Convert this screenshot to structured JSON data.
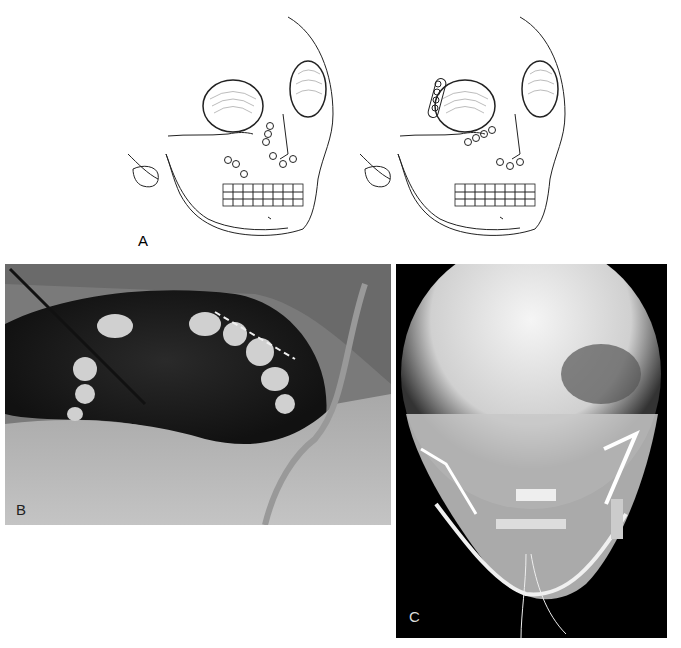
{
  "figure": {
    "panels": [
      {
        "id": "A",
        "label": "A",
        "description": "Line illustrations of skull showing fracture fixation with miniplates and arch bars, two views"
      },
      {
        "id": "B",
        "label": "B",
        "description": "Intraoperative photograph of oral cavity with arch bar on teeth and instrument"
      },
      {
        "id": "C",
        "label": "C",
        "description": "Frontal radiograph of skull showing plates and wires"
      }
    ],
    "colors": {
      "background": "#ffffff",
      "line_art": "#222222",
      "photo_dark": "#1a1a1a",
      "photo_mid": "#8c8c8c",
      "xray_bg": "#000000",
      "xray_bone": "#e8e8e8"
    }
  }
}
